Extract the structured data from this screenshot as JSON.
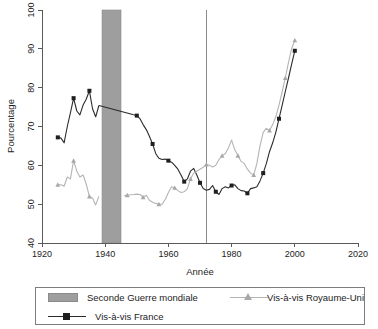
{
  "chart_data": {
    "type": "line",
    "title": "",
    "xlabel": "Année",
    "ylabel": "Pourcentage",
    "xlim": [
      1920,
      2020
    ],
    "ylim": [
      40,
      100
    ],
    "xticks": [
      1920,
      1940,
      1960,
      1980,
      2000,
      2020
    ],
    "yticks": [
      40,
      50,
      60,
      70,
      80,
      90,
      100
    ],
    "grid": false,
    "legend_position": "bottom",
    "annotations": [
      {
        "name": "seconde-guerre-mondiale-band",
        "type": "vspan",
        "label": "Seconde Guerre mondiale",
        "x_start": 1939,
        "x_end": 1945,
        "color": "#9e9e9e"
      },
      {
        "name": "vertical-reference-line",
        "type": "vline",
        "x": 1972,
        "color": "#8c8c8c"
      }
    ],
    "series": [
      {
        "name": "Vis-à-vis France",
        "color": "#2b2b2b",
        "marker": "square",
        "x": [
          1925,
          1926,
          1927,
          1928,
          1929,
          1930,
          1931,
          1932,
          1933,
          1934,
          1935,
          1936,
          1937,
          1938,
          1949,
          1950,
          1951,
          1952,
          1953,
          1954,
          1955,
          1956,
          1957,
          1958,
          1959,
          1960,
          1961,
          1962,
          1963,
          1964,
          1965,
          1966,
          1967,
          1968,
          1969,
          1970,
          1971,
          1972,
          1973,
          1974,
          1975,
          1976,
          1977,
          1978,
          1979,
          1980,
          1981,
          1982,
          1983,
          1984,
          1985,
          1986,
          1987,
          1988,
          1989,
          1990,
          1991,
          1992,
          1993,
          1994,
          1995,
          1996,
          1997,
          1998,
          1999,
          2000
        ],
        "values": [
          67.2,
          67.0,
          65.8,
          70.0,
          73.5,
          77.3,
          74.0,
          73.0,
          75.5,
          77.0,
          79.2,
          74.5,
          72.5,
          75.4,
          73.0,
          72.8,
          72.0,
          70.5,
          69.2,
          67.5,
          65.5,
          63.0,
          61.8,
          61.5,
          61.6,
          61.2,
          60.8,
          60.0,
          59.0,
          57.5,
          55.8,
          56.5,
          58.5,
          59.2,
          57.5,
          55.5,
          54.0,
          53.6,
          53.8,
          54.8,
          53.2,
          52.5,
          54.0,
          54.5,
          54.2,
          54.8,
          55.0,
          54.0,
          53.5,
          53.4,
          52.8,
          54.0,
          54.2,
          54.5,
          56.0,
          58.0,
          60.5,
          63.5,
          65.8,
          68.5,
          72.0,
          75.5,
          79.0,
          82.5,
          86.0,
          89.5
        ]
      },
      {
        "name": "Vis-à-vis Royaume-Uni",
        "color": "#b4b4b4",
        "marker": "triangle",
        "x": [
          1925,
          1926,
          1927,
          1928,
          1929,
          1930,
          1931,
          1932,
          1933,
          1934,
          1935,
          1936,
          1937,
          1938,
          1946,
          1947,
          1948,
          1949,
          1950,
          1951,
          1952,
          1953,
          1954,
          1955,
          1956,
          1957,
          1958,
          1959,
          1960,
          1961,
          1962,
          1963,
          1964,
          1965,
          1966,
          1967,
          1968,
          1969,
          1970,
          1971,
          1972,
          1973,
          1974,
          1975,
          1976,
          1977,
          1978,
          1979,
          1980,
          1981,
          1982,
          1983,
          1984,
          1985,
          1986,
          1987,
          1988,
          1989,
          1990,
          1991,
          1992,
          1993,
          1994,
          1995,
          1996,
          1997,
          1998,
          1999,
          2000
        ],
        "values": [
          55.0,
          55.0,
          54.6,
          57.0,
          56.5,
          61.2,
          58.5,
          57.0,
          57.5,
          55.2,
          52.0,
          51.5,
          49.8,
          52.0,
          52.2,
          52.3,
          52.4,
          52.5,
          52.6,
          52.5,
          51.8,
          52.3,
          51.0,
          50.5,
          50.2,
          50.0,
          50.0,
          51.2,
          53.0,
          54.5,
          54.2,
          53.5,
          53.0,
          53.2,
          54.0,
          56.5,
          58.0,
          58.5,
          59.0,
          59.5,
          60.2,
          60.0,
          59.6,
          60.0,
          61.5,
          62.5,
          63.0,
          64.5,
          66.5,
          64.0,
          62.5,
          61.0,
          60.5,
          59.0,
          58.0,
          57.5,
          60.5,
          65.0,
          68.5,
          69.5,
          69.0,
          70.5,
          72.5,
          75.5,
          79.0,
          82.5,
          86.5,
          90.0,
          92.2
        ]
      }
    ],
    "legend": [
      {
        "label": "Seconde Guerre mondiale",
        "swatch": "band",
        "color": "#9e9e9e"
      },
      {
        "label": "Vis-à-vis Royaume-Uni",
        "swatch": "line-triangle",
        "color": "#b4b4b4"
      },
      {
        "label": "Vis-à-vis France",
        "swatch": "line-square",
        "color": "#2b2b2b"
      }
    ]
  }
}
